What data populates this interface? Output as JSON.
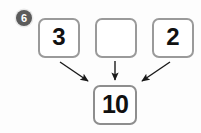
{
  "exercise": {
    "number_label": "6",
    "badge_fill": "#5b5b5b",
    "badge_text_color": "#ffffff"
  },
  "page": {
    "background": "#fdfdfd",
    "box_border_color": "#9a9a9a",
    "box_fill": "#ffffff",
    "arrow_color": "#1a1a1a",
    "digit_color": "#111111"
  },
  "diagram": {
    "type": "addition-number-bond",
    "operator_implied": "+",
    "addends": [
      {
        "id": "addend-1",
        "value": "3",
        "filled": true
      },
      {
        "id": "addend-2",
        "value": "",
        "filled": false
      },
      {
        "id": "addend-3",
        "value": "2",
        "filled": true
      }
    ],
    "result": {
      "id": "sum",
      "value": "10"
    },
    "arrows": [
      {
        "id": "arrow-left",
        "from": "addend-1",
        "to": "sum",
        "direction": "down-right"
      },
      {
        "id": "arrow-middle",
        "from": "addend-2",
        "to": "sum",
        "direction": "down"
      },
      {
        "id": "arrow-right",
        "from": "addend-3",
        "to": "sum",
        "direction": "down-left"
      }
    ]
  }
}
